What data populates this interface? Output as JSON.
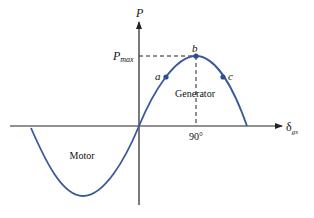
{
  "diagram": {
    "title": "",
    "axes": {
      "y_label": "P",
      "x_label_main": "δ",
      "x_label_sub": "gs"
    },
    "labels": {
      "pmax_main": "P",
      "pmax_sub": "max",
      "point_a": "a",
      "point_b": "b",
      "point_c": "c",
      "region_generator": "Generator",
      "region_motor": "Motor",
      "tick_90": "90°"
    },
    "colors": {
      "curve": "#3a5a9a",
      "axis": "#222222",
      "points": "#2e4f8f",
      "text": "#111111"
    }
  }
}
